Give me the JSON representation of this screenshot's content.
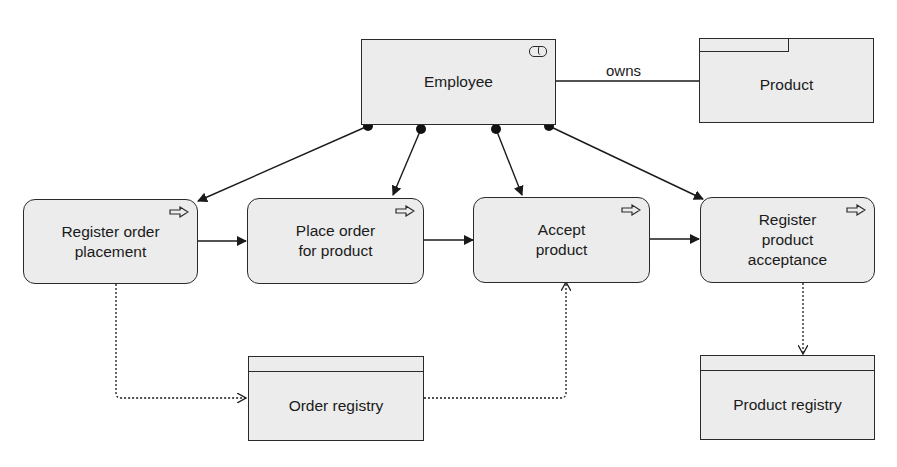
{
  "diagram": {
    "type": "ArchiMate business process view",
    "nodes": {
      "employee": {
        "label": "Employee",
        "kind": "business-role",
        "icon": "role-icon"
      },
      "product": {
        "label": "Product",
        "kind": "product",
        "icon": "product-tab"
      },
      "register_order": {
        "label": "Register order\nplacement",
        "kind": "business-process",
        "icon": "process-arrow-icon"
      },
      "place_order": {
        "label": "Place order\nfor product",
        "kind": "business-process",
        "icon": "process-arrow-icon"
      },
      "accept_product": {
        "label": "Accept\nproduct",
        "kind": "business-process",
        "icon": "process-arrow-icon"
      },
      "register_acceptance": {
        "label": "Register\nproduct\nacceptance",
        "kind": "business-process",
        "icon": "process-arrow-icon"
      },
      "order_registry": {
        "label": "Order registry",
        "kind": "business-object"
      },
      "product_registry": {
        "label": "Product registry",
        "kind": "business-object"
      }
    },
    "edges": [
      {
        "from": "employee",
        "to": "product",
        "kind": "association",
        "label": "owns"
      },
      {
        "from": "employee",
        "to": "register_order",
        "kind": "assignment"
      },
      {
        "from": "employee",
        "to": "place_order",
        "kind": "assignment"
      },
      {
        "from": "employee",
        "to": "accept_product",
        "kind": "assignment"
      },
      {
        "from": "employee",
        "to": "register_acceptance",
        "kind": "assignment"
      },
      {
        "from": "register_order",
        "to": "place_order",
        "kind": "triggering"
      },
      {
        "from": "place_order",
        "to": "accept_product",
        "kind": "triggering"
      },
      {
        "from": "accept_product",
        "to": "register_acceptance",
        "kind": "triggering"
      },
      {
        "from": "register_order",
        "to": "order_registry",
        "kind": "access-write"
      },
      {
        "from": "order_registry",
        "to": "accept_product",
        "kind": "access-read"
      },
      {
        "from": "register_acceptance",
        "to": "product_registry",
        "kind": "access-write"
      }
    ],
    "colors": {
      "fill": "#ececec",
      "stroke": "#2a2a2a",
      "background": "#ffffff"
    }
  }
}
